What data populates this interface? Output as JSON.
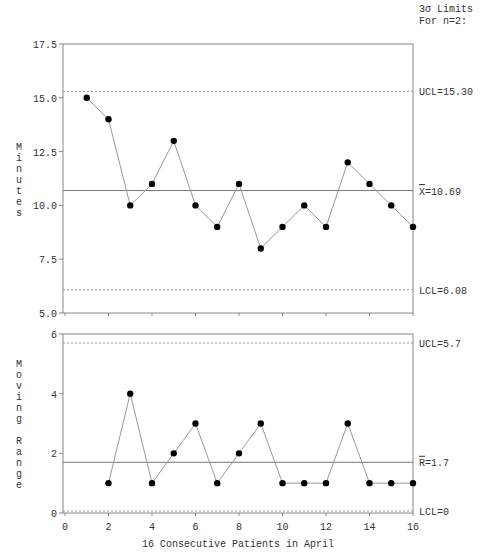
{
  "chart_data": [
    {
      "type": "line",
      "name": "individuals-chart",
      "ylabel": "Minutes",
      "x": [
        1,
        2,
        3,
        4,
        5,
        6,
        7,
        8,
        9,
        10,
        11,
        12,
        13,
        14,
        15,
        16
      ],
      "values": [
        15,
        14,
        10,
        11,
        13,
        10,
        9,
        11,
        8,
        9,
        10,
        9,
        12,
        11,
        10,
        9
      ],
      "xlim": [
        0,
        16
      ],
      "ylim": [
        5.0,
        17.5
      ],
      "yticks": [
        5.0,
        7.5,
        10.0,
        12.5,
        15.0,
        17.5
      ],
      "ytick_labels": [
        "5.0",
        "7.5",
        "10.0",
        "12.5",
        "15.0",
        "17.5"
      ],
      "limits_header": [
        "3σ Limits",
        "For n=2:"
      ],
      "ucl": 15.3,
      "ucl_label": "UCL=15.30",
      "center": 10.69,
      "center_label": "X=10.69",
      "lcl": 6.08,
      "lcl_label": "LCL=6.08",
      "grid": false
    },
    {
      "type": "line",
      "name": "moving-range-chart",
      "ylabel": "Moving Range",
      "xlabel": "16 Consecutive Patients in April",
      "x": [
        2,
        3,
        4,
        5,
        6,
        7,
        8,
        9,
        10,
        11,
        12,
        13,
        14,
        15,
        16
      ],
      "values": [
        1,
        4,
        1,
        2,
        3,
        1,
        2,
        3,
        1,
        1,
        1,
        3,
        1,
        1,
        1
      ],
      "xlim": [
        0,
        16
      ],
      "ylim": [
        0,
        6
      ],
      "xticks": [
        0,
        2,
        4,
        6,
        8,
        10,
        12,
        14,
        16
      ],
      "xtick_labels": [
        "0",
        "2",
        "4",
        "6",
        "8",
        "10",
        "12",
        "14",
        "16"
      ],
      "yticks": [
        0,
        2,
        4,
        6
      ],
      "ytick_labels": [
        "0",
        "2",
        "4",
        "6"
      ],
      "ucl": 5.7,
      "ucl_label": "UCL=5.7",
      "center": 1.7,
      "center_label": "R=1.7",
      "lcl": 0,
      "lcl_label": "LCL=0",
      "grid": false
    }
  ]
}
